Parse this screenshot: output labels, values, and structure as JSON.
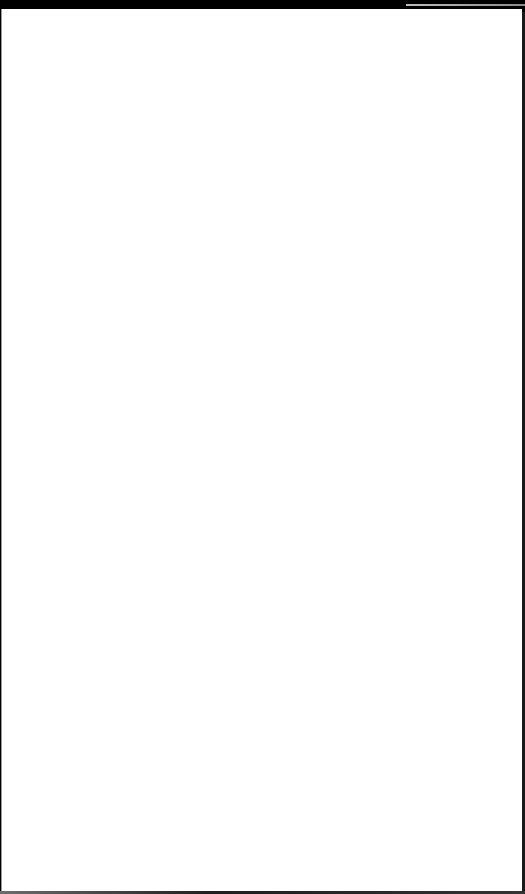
{
  "window": {
    "background_color": "#000000",
    "page_color": "#ffffff"
  },
  "page": {
    "content": ""
  }
}
